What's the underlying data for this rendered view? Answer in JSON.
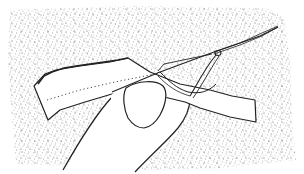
{
  "illustration": {
    "subject": "hand sewing a running stitch through a fabric strip with needle and thread",
    "colors": {
      "background": "#ffffff",
      "ink": "#222222",
      "stipple": "#555555",
      "fabric": "#ffffff",
      "skin": "#ffffff"
    },
    "elements": [
      {
        "name": "stippled-backdrop",
        "label": "Stippled background panel"
      },
      {
        "name": "fabric-strip",
        "label": "Strip of fabric"
      },
      {
        "name": "stitch-line",
        "label": "Dotted stitch line"
      },
      {
        "name": "hand",
        "label": "Hand holding fabric"
      },
      {
        "name": "thumbnail",
        "label": "Thumbnail"
      },
      {
        "name": "needle",
        "label": "Needle"
      },
      {
        "name": "thread",
        "label": "Thread loop"
      }
    ]
  }
}
